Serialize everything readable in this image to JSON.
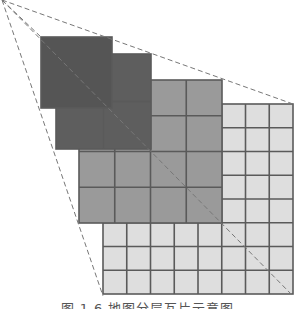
{
  "figure": {
    "caption": "图 1.6  地图分层瓦片示意图",
    "colors": {
      "background": "#ffffff",
      "grid_line": "#5a5a5a",
      "dashed_line": "#777777",
      "level_0": "#555555",
      "level_1": "#5e5e5e",
      "level_2": "#9a9a9a",
      "level_3": "#dedede"
    },
    "apex": {
      "x": 2,
      "y": 0
    },
    "levels": [
      {
        "name": "level-0",
        "grid": 1,
        "x": 41,
        "y": 37,
        "size": 71,
        "fill": "#555555"
      },
      {
        "name": "level-1",
        "grid": 2,
        "x": 56,
        "y": 54,
        "size": 95,
        "fill": "#5e5e5e"
      },
      {
        "name": "level-2",
        "grid": 4,
        "x": 79,
        "y": 80,
        "size": 143,
        "fill": "#9a9a9a"
      },
      {
        "name": "level-3",
        "grid": 8,
        "x": 103,
        "y": 104,
        "size": 190,
        "fill": "#dedede"
      }
    ],
    "dashed_lines": [
      {
        "name": "edge-to-top-right",
        "x1": 2,
        "y1": 0,
        "x2": 293,
        "y2": 104
      },
      {
        "name": "edge-to-level0-corner",
        "x1": 2,
        "y1": 0,
        "x2": 41,
        "y2": 37
      },
      {
        "name": "edge-to-bottom-left",
        "x1": 2,
        "y1": 0,
        "x2": 103,
        "y2": 296
      },
      {
        "name": "diagonal-to-bottom-right",
        "x1": 2,
        "y1": 0,
        "x2": 293,
        "y2": 296
      }
    ]
  }
}
